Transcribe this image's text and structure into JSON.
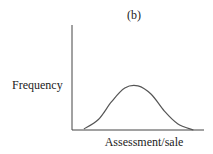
{
  "chart_data": {
    "type": "line",
    "title": "(b)",
    "xlabel": "Assessment/sale",
    "ylabel": "Frequency",
    "grid": false,
    "legend": "none",
    "xlim": [
      0,
      1
    ],
    "ylim": [
      0,
      1
    ],
    "series": [
      {
        "name": "distribution",
        "shape": "bell-shaped (normal) curve",
        "x": [
          0.09,
          0.2,
          0.3,
          0.4,
          0.5,
          0.6,
          0.7,
          0.8,
          0.92
        ],
        "y": [
          0.01,
          0.1,
          0.27,
          0.4,
          0.42,
          0.34,
          0.18,
          0.06,
          0.0
        ]
      }
    ]
  }
}
